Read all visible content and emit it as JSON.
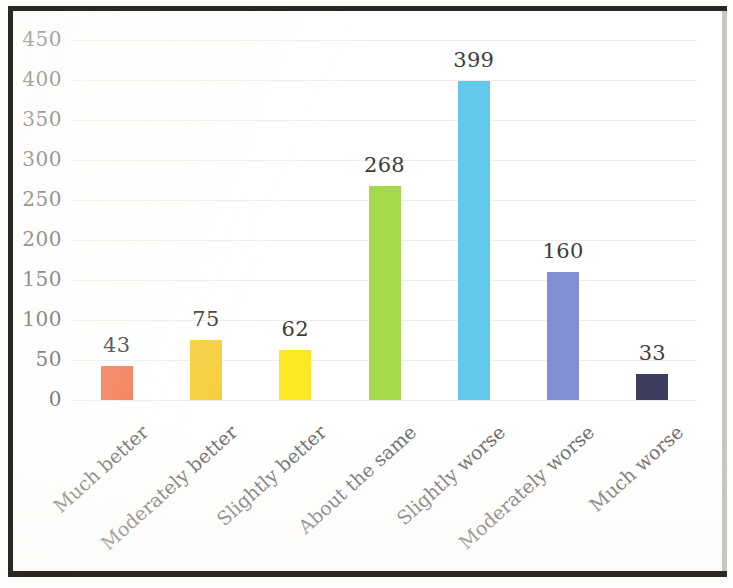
{
  "chart_data": {
    "type": "bar",
    "title": "",
    "subtitle": "",
    "xlabel": "",
    "ylabel": "",
    "ylim": [
      0,
      450
    ],
    "ytick_step": 50,
    "ytick_labels": [
      "0",
      "50",
      "100",
      "150",
      "200",
      "250",
      "300",
      "350",
      "400",
      "450"
    ],
    "ytick_values": [
      0,
      50,
      100,
      150,
      200,
      250,
      300,
      350,
      400,
      450
    ],
    "grid": true,
    "grid_axis": "y",
    "legend": false,
    "legend_position": "none",
    "categories": [
      "Much better",
      "Moderately better",
      "Slightly better",
      "About the same",
      "Slightly worse",
      "Moderately worse",
      "Much worse"
    ],
    "values": [
      43,
      75,
      62,
      268,
      399,
      160,
      33
    ],
    "data_labels": [
      "43",
      "75",
      "62",
      "268",
      "399",
      "160",
      "33"
    ],
    "bar_colors": [
      "#F4764E",
      "#F6CF3E",
      "#FBE824",
      "#A6D94A",
      "#63C9EC",
      "#828FD7",
      "#3E3D5F"
    ],
    "grid_color": "#EEEDEA",
    "axis_text_color": "#58585A",
    "label_text_color": "#3C3C3E",
    "category_text_color": "#6B6B6E",
    "background_color": "#FFFFFF",
    "frame_color": "#2A2724"
  }
}
